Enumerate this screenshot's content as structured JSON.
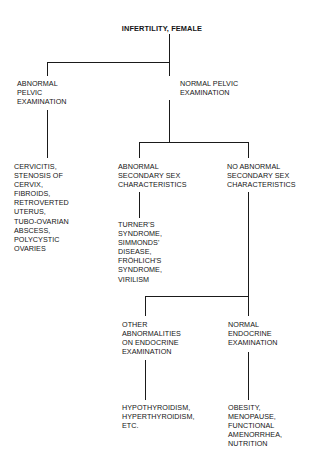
{
  "diagram": {
    "title": "INFERTILITY, FEMALE",
    "type": "clinical-differential-diagnosis-flowchart",
    "nodes": {
      "root": "INFERTILITY, FEMALE",
      "abnormal_pelvic_exam": "ABNORMAL\nPELVIC\nEXAMINATION",
      "normal_pelvic_exam": "NORMAL PELVIC\nEXAMINATION",
      "abnormal_pelvic_findings": "CERVICITIS,\nSTENOSIS OF\nCERVIX,\nFIBROIDS,\nRETROVERTED\nUTERUS,\nTUBO-OVARIAN\nABSCESS,\nPOLYCYSTIC\nOVARIES",
      "abnormal_secondary_sex": "ABNORMAL\nSECONDARY SEX\nCHARACTERISTICS",
      "no_abnormal_secondary_sex": "NO ABNORMAL\nSECONDARY SEX\nCHARACTERISTICS",
      "abnormal_secondary_sex_findings": "TURNER'S\nSYNDROME,\nSIMMONDS'\nDISEASE,\nFRÖHLICH'S\nSYNDROME,\nVIRILISM",
      "other_endocrine_abnormalities": "OTHER\nABNORMALITIES\nON ENDOCRINE\nEXAMINATION",
      "normal_endocrine_exam": "NORMAL\nENDOCRINE\nEXAMINATION",
      "other_endocrine_findings": "HYPOTHYROIDISM,\nHYPERTHYROIDISM,\nETC.",
      "normal_endocrine_findings": "OBESITY,\nMENOPAUSE,\nFUNCTIONAL\nAMENORRHEA,\nNUTRITION"
    },
    "colors": {
      "background": "#ffffff",
      "text": "#151515",
      "connector": "#1a1a1a"
    }
  }
}
